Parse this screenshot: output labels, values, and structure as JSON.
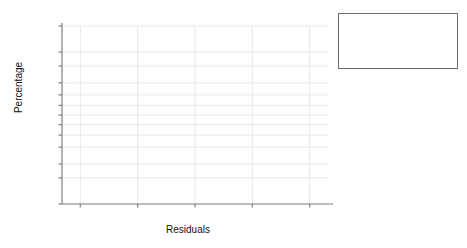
{
  "chart_data": {
    "type": "scatter",
    "title": "",
    "xlabel": "Residuals",
    "ylabel": "Percentage",
    "xlim": [
      -12,
      12
    ],
    "ylim": [
      1,
      99
    ],
    "grid": true,
    "probability_plot": true,
    "xticks": [
      "-10",
      "-5",
      "0",
      "5",
      "10"
    ],
    "xtick_values": [
      -10,
      -5,
      0,
      5,
      10
    ],
    "yticks": [
      "1",
      "5",
      "10",
      "20",
      "30",
      "40",
      "50",
      "60",
      "70",
      "80",
      "90",
      "95",
      "99"
    ],
    "ytick_values": [
      1,
      5,
      10,
      20,
      30,
      40,
      50,
      60,
      70,
      80,
      90,
      95,
      99
    ],
    "fit_line": {
      "x": [
        -10.2,
        10.5
      ],
      "y": [
        1.0,
        99.2
      ]
    },
    "series": [
      {
        "name": "Residuals",
        "marker": "filled-circle",
        "color": "#111111",
        "points": [
          {
            "x": -8.6,
            "y": 4.0
          },
          {
            "x": -7.1,
            "y": 8.0
          },
          {
            "x": -6.3,
            "y": 12.0
          },
          {
            "x": -5.2,
            "y": 16.0
          },
          {
            "x": -4.6,
            "y": 20.0
          },
          {
            "x": -4.4,
            "y": 24.0
          },
          {
            "x": -3.2,
            "y": 28.0
          },
          {
            "x": -2.0,
            "y": 32.0
          },
          {
            "x": -1.5,
            "y": 36.0
          },
          {
            "x": -1.3,
            "y": 40.0
          },
          {
            "x": -1.1,
            "y": 44.0
          },
          {
            "x": -0.9,
            "y": 46.0
          },
          {
            "x": -0.6,
            "y": 48.0
          },
          {
            "x": 0.1,
            "y": 52.0
          },
          {
            "x": 0.6,
            "y": 56.0
          },
          {
            "x": 0.7,
            "y": 58.0
          },
          {
            "x": 0.8,
            "y": 62.0
          },
          {
            "x": 1.3,
            "y": 64.0
          },
          {
            "x": 1.5,
            "y": 68.0
          },
          {
            "x": 2.1,
            "y": 72.0
          },
          {
            "x": 3.3,
            "y": 76.0
          },
          {
            "x": 3.5,
            "y": 80.0
          },
          {
            "x": 4.3,
            "y": 84.0
          },
          {
            "x": 5.1,
            "y": 90.0
          },
          {
            "x": 6.5,
            "y": 96.0
          }
        ]
      }
    ]
  },
  "stats": {
    "rows": [
      {
        "key": "Mean",
        "value": "8.881784E–18",
        "italic_first": false
      },
      {
        "key": "SD",
        "value": "4.332",
        "italic_first": false
      },
      {
        "key": "N",
        "value": "25",
        "italic_first": true
      },
      {
        "key": "AD",
        "value": "0.266",
        "italic_first": false
      },
      {
        "key": "p-Value",
        "value": "0.662",
        "italic_first": true
      }
    ]
  },
  "colors": {
    "marker": "#111111",
    "axis": "#808080",
    "grid": "#e8e8e8",
    "box_border": "#6e6e6e",
    "text": "#111111"
  }
}
